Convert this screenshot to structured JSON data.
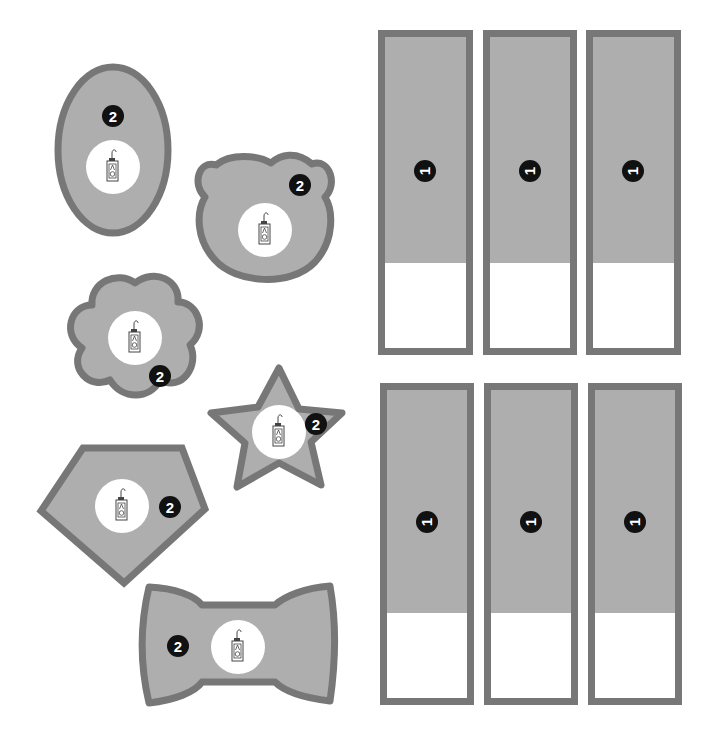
{
  "colors": {
    "outline": "#777777",
    "fill": "#aeaeae",
    "center": "#ffffff",
    "badge": "#111111",
    "background": "#ffffff"
  },
  "shapes": [
    {
      "name": "oval",
      "badge": "2",
      "icon": "bottle-icon"
    },
    {
      "name": "bear-head",
      "badge": "2",
      "icon": "bottle-icon"
    },
    {
      "name": "flower",
      "badge": "2",
      "icon": "bottle-icon"
    },
    {
      "name": "star",
      "badge": "2",
      "icon": "bottle-icon"
    },
    {
      "name": "pentagon",
      "badge": "2",
      "icon": "bottle-icon"
    },
    {
      "name": "bow-tie",
      "badge": "2",
      "icon": "bottle-icon"
    }
  ],
  "panels": {
    "top_row": [
      {
        "badge": "1"
      },
      {
        "badge": "1"
      },
      {
        "badge": "1"
      }
    ],
    "bottom_row": [
      {
        "badge": "1"
      },
      {
        "badge": "1"
      },
      {
        "badge": "1"
      }
    ]
  }
}
